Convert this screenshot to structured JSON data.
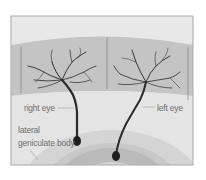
{
  "diagram": {
    "labels": {
      "right_eye": "right eye",
      "left_eye": "left eye",
      "lateral": "lateral",
      "geniculate_body": "geniculate body"
    },
    "caption_partial": "",
    "colors": {
      "frame_border": "#a9a9a9",
      "top_band": "#e8e8e8",
      "retina_band": "#c4c4c4",
      "lower_field": "#e4e4e4",
      "ring_outer": "#d2d2d2",
      "ring_middle": "#bdbdbd",
      "ring_inner": "#d8d8d8",
      "neuron": "#1e1e1e",
      "label_text": "#6f6f6f"
    }
  }
}
